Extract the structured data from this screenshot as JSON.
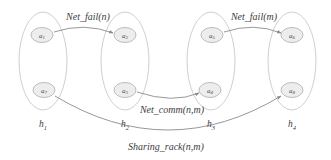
{
  "diagram": {
    "type": "graph",
    "width": 331,
    "height": 160,
    "colors": {
      "background": "#ffffff",
      "node_fill": "#ededed",
      "node_stroke": "#b4b4b4",
      "group_stroke": "#c9c9c9",
      "edge_stroke": "#8c8c8c",
      "text": "#3d3d3d"
    },
    "nodes": [
      {
        "id": "a1",
        "base": "a",
        "sub": "1",
        "x": 42,
        "y": 35,
        "rx": 11,
        "ry": 7.5,
        "group": "h1"
      },
      {
        "id": "a2",
        "base": "a",
        "sub": "2",
        "x": 125,
        "y": 35,
        "rx": 11,
        "ry": 7.5,
        "group": "h2"
      },
      {
        "id": "a5",
        "base": "a",
        "sub": "5",
        "x": 212,
        "y": 35,
        "rx": 11,
        "ry": 7.5,
        "group": "h3"
      },
      {
        "id": "a6",
        "base": "a",
        "sub": "6",
        "x": 292,
        "y": 35,
        "rx": 11,
        "ry": 7.5,
        "group": "h4"
      },
      {
        "id": "a7",
        "base": "a",
        "sub": "7",
        "x": 44,
        "y": 90,
        "rx": 11,
        "ry": 7.5,
        "group": "h1"
      },
      {
        "id": "a3",
        "base": "a",
        "sub": "3",
        "x": 125,
        "y": 90,
        "rx": 11,
        "ry": 7.5,
        "group": "h2"
      },
      {
        "id": "a4",
        "base": "a",
        "sub": "4",
        "x": 210,
        "y": 90,
        "rx": 11,
        "ry": 7.5,
        "group": "h3"
      },
      {
        "id": "a8",
        "base": "a",
        "sub": "8",
        "x": 292,
        "y": 90,
        "rx": 11,
        "ry": 7.5,
        "group": "h4"
      }
    ],
    "groups": [
      {
        "id": "h1",
        "base": "h",
        "sub": "1",
        "cx": 43,
        "cy": 61,
        "rx": 24,
        "ry": 49,
        "label_x": 43,
        "label_y": 127
      },
      {
        "id": "h2",
        "base": "h",
        "sub": "2",
        "cx": 125,
        "cy": 61,
        "rx": 24,
        "ry": 49,
        "label_x": 125,
        "label_y": 127
      },
      {
        "id": "h3",
        "base": "h",
        "sub": "3",
        "cx": 211,
        "cy": 61,
        "rx": 24,
        "ry": 49,
        "label_x": 211,
        "label_y": 127
      },
      {
        "id": "h4",
        "base": "h",
        "sub": "4",
        "cx": 292,
        "cy": 61,
        "rx": 24,
        "ry": 49,
        "label_x": 292,
        "label_y": 127
      }
    ],
    "edges": [
      {
        "id": "edge-net-fail-n",
        "label": "Net_fail(n)",
        "from": "a1",
        "to": "a2",
        "path": "M 54 32 Q 84 22 113 33",
        "label_x": 88,
        "label_y": 20
      },
      {
        "id": "edge-net-fail-m",
        "label": "Net_fail(m)",
        "from": "a5",
        "to": "a6",
        "path": "M 224 32 Q 254 22 281 33",
        "label_x": 254,
        "label_y": 20
      },
      {
        "id": "edge-net-comm-nm",
        "label": "Net_comm(n,m)",
        "from": "a3",
        "to": "a4",
        "path": "M 137 92 Q 173 104 199 93",
        "label_x": 172,
        "label_y": 113
      },
      {
        "id": "edge-sharing-rack-nm",
        "label": "Sharing_rack(n,m)",
        "from": "a7",
        "to": "a8",
        "path": "M 55 96 Q 168 164 281 96",
        "label_x": 166,
        "label_y": 150
      }
    ]
  }
}
